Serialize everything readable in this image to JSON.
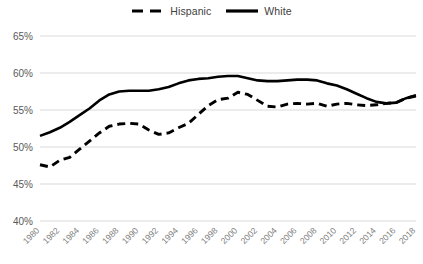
{
  "legend": {
    "position": "top-center",
    "items": [
      {
        "label": "Hispanic",
        "style": "dashed",
        "color": "#000000",
        "icon": "dashed-line-icon"
      },
      {
        "label": "White",
        "style": "solid",
        "color": "#000000",
        "icon": "solid-line-icon"
      }
    ]
  },
  "axes": {
    "y_ticks": [
      "40%",
      "45%",
      "50%",
      "55%",
      "60%",
      "65%"
    ],
    "x_ticks": [
      "1980",
      "1982",
      "1984",
      "1986",
      "1988",
      "1990",
      "1992",
      "1994",
      "1996",
      "1998",
      "2000",
      "2002",
      "2004",
      "2006",
      "2008",
      "2010",
      "2012",
      "2014",
      "2016",
      "2018"
    ]
  },
  "chart_data": {
    "type": "line",
    "title": "",
    "xlabel": "",
    "ylabel": "",
    "ylim": [
      40,
      65
    ],
    "ytick_step": 5,
    "ytick_format": "percent",
    "xlim": [
      1980,
      2018
    ],
    "grid": "horizontal",
    "legend_position": "top-center",
    "x": [
      1980,
      1981,
      1982,
      1983,
      1984,
      1985,
      1986,
      1987,
      1988,
      1989,
      1990,
      1991,
      1992,
      1993,
      1994,
      1995,
      1996,
      1997,
      1998,
      1999,
      2000,
      2001,
      2002,
      2003,
      2004,
      2005,
      2006,
      2007,
      2008,
      2009,
      2010,
      2011,
      2012,
      2013,
      2014,
      2015,
      2016,
      2017,
      2018
    ],
    "series": [
      {
        "name": "Hispanic",
        "style": "dashed",
        "color": "#000000",
        "values": [
          47.6,
          47.3,
          48.2,
          48.6,
          49.7,
          50.8,
          51.9,
          52.8,
          53.1,
          53.2,
          53.1,
          52.3,
          51.7,
          51.9,
          52.6,
          53.2,
          54.4,
          55.6,
          56.4,
          56.6,
          57.4,
          57.1,
          56.3,
          55.5,
          55.4,
          55.8,
          55.9,
          55.8,
          55.9,
          55.5,
          55.8,
          55.9,
          55.7,
          55.6,
          55.7,
          55.9,
          56.0,
          56.6,
          56.9
        ]
      },
      {
        "name": "White",
        "style": "solid",
        "color": "#000000",
        "values": [
          51.5,
          52.0,
          52.6,
          53.4,
          54.3,
          55.2,
          56.3,
          57.1,
          57.5,
          57.6,
          57.6,
          57.6,
          57.8,
          58.1,
          58.6,
          59.0,
          59.2,
          59.3,
          59.5,
          59.6,
          59.6,
          59.3,
          59.0,
          58.9,
          58.9,
          59.0,
          59.1,
          59.1,
          59.0,
          58.6,
          58.3,
          57.8,
          57.2,
          56.6,
          56.1,
          55.9,
          56.0,
          56.6,
          57.0
        ]
      }
    ]
  }
}
